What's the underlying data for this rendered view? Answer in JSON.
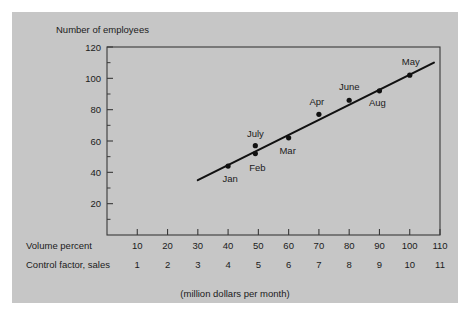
{
  "figure": {
    "background_color": "#c6c6c6",
    "page_color": "#ffffff",
    "caption": "(million dollars per month)",
    "y_axis_title": "Number of employees",
    "x_axis_row1_label": "Volume percent",
    "x_axis_row2_label": "Control factor, sales"
  },
  "chart_data": {
    "type": "scatter",
    "title": "",
    "subtitle": "",
    "xlabel": "Volume percent",
    "ylabel": "Number of employees",
    "caption": "(million dollars per month)",
    "xlim": [
      0,
      110
    ],
    "ylim": [
      0,
      120
    ],
    "grid": false,
    "legend": "none",
    "y_ticks": [
      20,
      40,
      60,
      80,
      100,
      120
    ],
    "y_minor_ticks": [
      10,
      30,
      50,
      70,
      90,
      110
    ],
    "x_ticks": [
      10,
      20,
      30,
      40,
      50,
      60,
      70,
      80,
      90,
      100,
      110
    ],
    "x_secondary_ticks": [
      1,
      2,
      3,
      4,
      5,
      6,
      7,
      8,
      9,
      10,
      11
    ],
    "x_secondary_label": "Control factor, sales",
    "point_color": "#111111",
    "line_color": "#111111",
    "points": [
      {
        "label": "Jan",
        "x": 40,
        "y": 44,
        "label_dx": 2,
        "label_dy": 16
      },
      {
        "label": "Feb",
        "x": 49,
        "y": 52,
        "label_dx": 2,
        "label_dy": 17
      },
      {
        "label": "July",
        "x": 49,
        "y": 57,
        "label_dx": 0,
        "label_dy": -9
      },
      {
        "label": "Mar",
        "x": 60,
        "y": 62,
        "label_dx": -1,
        "label_dy": 16
      },
      {
        "label": "Apr",
        "x": 70,
        "y": 77,
        "label_dx": -2,
        "label_dy": -9
      },
      {
        "label": "June",
        "x": 80,
        "y": 86,
        "label_dx": 0,
        "label_dy": -10
      },
      {
        "label": "Aug",
        "x": 90,
        "y": 92,
        "label_dx": -2,
        "label_dy": 15
      },
      {
        "label": "May",
        "x": 100,
        "y": 102,
        "label_dx": 1,
        "label_dy": -10
      }
    ],
    "trendline": {
      "x0": 30,
      "y0": 35,
      "x1": 108,
      "y1": 110
    }
  }
}
